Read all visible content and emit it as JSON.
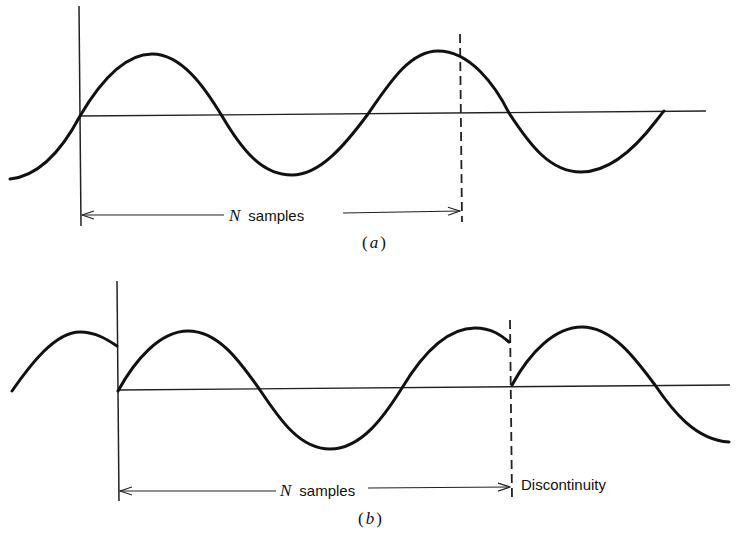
{
  "figure_a": {
    "dimension_label_symbol": "N",
    "dimension_label_text": "samples",
    "caption_open": "(",
    "caption_letter": "a",
    "caption_close": ")"
  },
  "figure_b": {
    "dimension_label_symbol": "N",
    "dimension_label_text": "samples",
    "annotation": "Discontinuity",
    "caption_open": "(",
    "caption_letter": "b",
    "caption_close": ")"
  }
}
